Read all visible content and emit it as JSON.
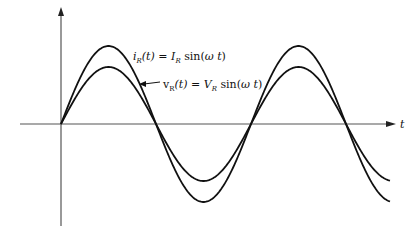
{
  "diagram": {
    "title": "",
    "axis": {
      "x_label": "t"
    },
    "curves": [
      {
        "name": "current",
        "label_lhs": "i",
        "label_lhs_sub": "R",
        "label_arg": "(t) = ",
        "label_amp": "I",
        "label_amp_sub": "R",
        "label_func": " sin(",
        "label_omega": "ω t",
        "label_close": ")",
        "amplitude_px": 78,
        "color": "#111111"
      },
      {
        "name": "voltage",
        "label_lhs": "v",
        "label_lhs_sub": "R",
        "label_arg": "(t) = ",
        "label_amp": "V",
        "label_amp_sub": "R",
        "label_func": " sin(",
        "label_omega": "ω t",
        "label_close": ")",
        "amplitude_px": 57,
        "color": "#111111"
      }
    ],
    "colors": {
      "axis": "#555555",
      "curve": "#111111",
      "background": "#ffffff"
    }
  }
}
